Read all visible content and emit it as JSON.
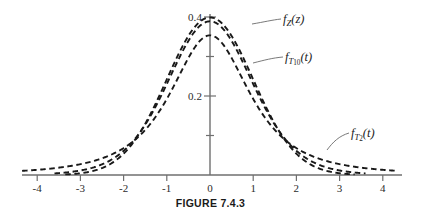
{
  "figure": {
    "caption": "FIGURE 7.4.3"
  },
  "axes": {
    "x_ticks": [
      "-4",
      "-3",
      "-2",
      "-1",
      "0",
      "1",
      "2",
      "3",
      "4"
    ],
    "x_tick_values": [
      -4,
      -3,
      -2,
      -1,
      0,
      1,
      2,
      3,
      4
    ],
    "y_ticks": [
      "0.2",
      "0.4"
    ],
    "y_tick_values": [
      0.2,
      0.4
    ],
    "xlim": [
      -4.45,
      4.45
    ],
    "ylim": [
      0,
      0.44
    ]
  },
  "labels": {
    "z": {
      "f": "f",
      "sub": "Z",
      "arg": "(z)"
    },
    "t10": {
      "f": "f",
      "sub": "T",
      "subsub": "10",
      "arg": "(t)"
    },
    "t2": {
      "f": "f",
      "sub": "T",
      "subsub": "2",
      "arg": "(t)"
    }
  },
  "style": {
    "curve_color": "#191919",
    "axis_color": "#6f6f6f",
    "leader_color": "#6a6a6a",
    "background": "#ffffff",
    "dash_pattern": "5.5 3.6"
  },
  "chart_data": {
    "type": "line",
    "title": "FIGURE 7.4.3",
    "xlabel": "",
    "ylabel": "",
    "xlim": [
      -4.45,
      4.45
    ],
    "ylim": [
      0,
      0.44
    ],
    "grid": false,
    "legend": "inline annotations with leader lines",
    "x": [
      -4.4,
      -4.2,
      -4,
      -3.8,
      -3.6,
      -3.4,
      -3.2,
      -3,
      -2.8,
      -2.6,
      -2.4,
      -2.2,
      -2,
      -1.8,
      -1.6,
      -1.4,
      -1.2,
      -1,
      -0.8,
      -0.6,
      -0.4,
      -0.2,
      0,
      0.2,
      0.4,
      0.6,
      0.8,
      1,
      1.2,
      1.4,
      1.6,
      1.8,
      2,
      2.2,
      2.4,
      2.6,
      2.8,
      3,
      3.2,
      3.4,
      3.6,
      3.8,
      4,
      4.2,
      4.4
    ],
    "series": [
      {
        "name": "f_Z(z)",
        "description": "standard normal density",
        "peak": 0.3989,
        "values": [
          0.0,
          0.0001,
          0.0001,
          0.0003,
          0.0006,
          0.0012,
          0.0024,
          0.0044,
          0.0079,
          0.0136,
          0.0224,
          0.0355,
          0.054,
          0.079,
          0.1109,
          0.1497,
          0.1942,
          0.242,
          0.2897,
          0.3332,
          0.3683,
          0.391,
          0.3989,
          0.391,
          0.3683,
          0.3332,
          0.2897,
          0.242,
          0.1942,
          0.1497,
          0.1109,
          0.079,
          0.054,
          0.0355,
          0.0224,
          0.0136,
          0.0079,
          0.0044,
          0.0024,
          0.0012,
          0.0006,
          0.0003,
          0.0001,
          0.0001,
          0.0
        ]
      },
      {
        "name": "f_T10(t)",
        "description": "Student t density with 10 degrees of freedom",
        "peak": 0.3891,
        "values": [
          0.0011,
          0.0014,
          0.0019,
          0.0025,
          0.0033,
          0.0044,
          0.0059,
          0.0081,
          0.0111,
          0.0154,
          0.0216,
          0.0306,
          0.0435,
          0.0619,
          0.0876,
          0.122,
          0.1653,
          0.2152,
          0.2661,
          0.3109,
          0.3432,
          0.3604,
          0.3891,
          0.3604,
          0.3432,
          0.3109,
          0.2661,
          0.2152,
          0.1653,
          0.122,
          0.0876,
          0.0619,
          0.0435,
          0.0306,
          0.0216,
          0.0154,
          0.0111,
          0.0081,
          0.0059,
          0.0044,
          0.0033,
          0.0025,
          0.0019,
          0.0014,
          0.0011
        ]
      },
      {
        "name": "f_T2(t)",
        "description": "Student t density with 2 degrees of freedom",
        "peak": 0.3536,
        "values": [
          0.0079,
          0.009,
          0.0104,
          0.012,
          0.0139,
          0.0163,
          0.0191,
          0.0227,
          0.0271,
          0.0327,
          0.0399,
          0.0493,
          0.0619,
          0.0788,
          0.1018,
          0.133,
          0.1744,
          0.228,
          0.2927,
          0.3623,
          0.4172,
          0.4351,
          0.3536,
          0.4351,
          0.4172,
          0.3623,
          0.2927,
          0.228,
          0.1744,
          0.133,
          0.1018,
          0.0788,
          0.0619,
          0.0493,
          0.0399,
          0.0327,
          0.0271,
          0.0227,
          0.0191,
          0.0163,
          0.0139,
          0.012,
          0.0104,
          0.009,
          0.0079
        ]
      }
    ]
  }
}
